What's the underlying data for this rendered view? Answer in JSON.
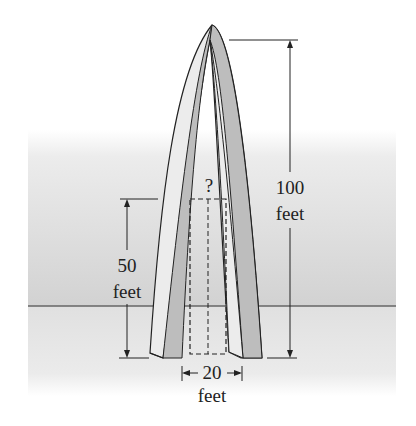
{
  "figure": {
    "labels": {
      "height_value": "100",
      "height_unit": "feet",
      "rect_height_value": "50",
      "rect_height_unit": "feet",
      "base_width_value": "20",
      "base_width_unit": "feet",
      "unknown": "?"
    },
    "colors": {
      "background_sky": "#ffffff",
      "background_wall": "#d4d4d4",
      "ground": "#e2e2e2",
      "ground_line": "#666666",
      "arch_front": "#ececec",
      "arch_side": "#bdbdbd",
      "outline": "#222222"
    }
  }
}
